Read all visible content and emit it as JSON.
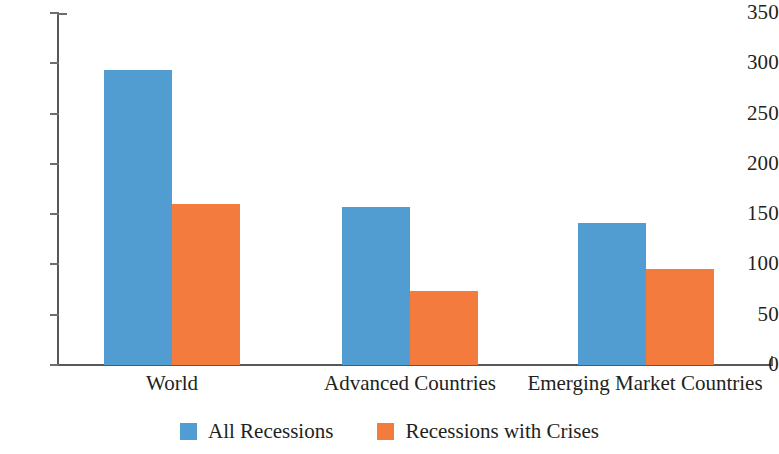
{
  "chart_data": {
    "type": "bar",
    "title": "",
    "subtitle": "",
    "xlabel": "",
    "ylabel": "",
    "ylim": [
      0,
      350
    ],
    "yticks": [
      0,
      50,
      100,
      150,
      200,
      250,
      300,
      350
    ],
    "ytick_labels": [
      "0",
      "50",
      "100",
      "150",
      "200",
      "250",
      "300",
      "350"
    ],
    "grid": false,
    "legend_position": "bottom-center",
    "categories": [
      "World",
      "Advanced Countries",
      "Emerging Market Countries"
    ],
    "series": [
      {
        "name": "All Recessions",
        "color": "#519CD0",
        "values": [
          293,
          157,
          141
        ]
      },
      {
        "name": "Recessions with Crises",
        "color": "#F47B3E",
        "values": [
          160,
          74,
          95
        ]
      }
    ]
  },
  "legend": {
    "items": [
      {
        "label": "All Recessions",
        "color": "#519CD0"
      },
      {
        "label": "Recessions with Crises",
        "color": "#F47B3E"
      }
    ]
  },
  "axis": {
    "y": {
      "max": 350,
      "ticks": [
        {
          "value": 350,
          "label": "350"
        },
        {
          "value": 300,
          "label": "300"
        },
        {
          "value": 250,
          "label": "250"
        },
        {
          "value": 200,
          "label": "200"
        },
        {
          "value": 150,
          "label": "150"
        },
        {
          "value": 100,
          "label": "100"
        },
        {
          "value": 50,
          "label": "50"
        },
        {
          "value": 0,
          "label": "0"
        }
      ]
    }
  },
  "colors": {
    "series_blue": "#519CD0",
    "series_orange": "#F47B3E",
    "axis": "#58585a",
    "text": "#231f20",
    "background": "#ffffff"
  },
  "geometry": {
    "plot_left": 58,
    "plot_top": 13,
    "plot_bottom": 365,
    "plot_height": 352,
    "bar_width": 68,
    "group_blue_left": [
      104,
      342,
      578
    ],
    "group_label_center": [
      172,
      410,
      645
    ]
  }
}
